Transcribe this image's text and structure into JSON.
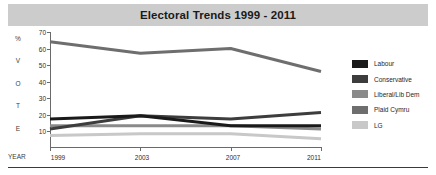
{
  "chart_data": {
    "type": "line",
    "title": "Electoral Trends 1999 - 2011",
    "xlabel": "YEAR",
    "ylabel": "% VOTE",
    "ylabel_chars": [
      "%",
      "V",
      "O",
      "T",
      "E"
    ],
    "categories": [
      "1999",
      "2003",
      "2007",
      "2011"
    ],
    "x": [
      1999,
      2003,
      2007,
      2011
    ],
    "ylim": [
      0,
      70
    ],
    "yticks": [
      70,
      60,
      50,
      40,
      30,
      20,
      10
    ],
    "grid": false,
    "legend_position": "right",
    "series": [
      {
        "name": "Labour",
        "color": "#1a1a1a",
        "values": [
          17,
          19,
          13,
          13
        ]
      },
      {
        "name": "Conservative",
        "color": "#3d3d3d",
        "values": [
          11,
          19,
          17,
          21
        ]
      },
      {
        "name": "Liberal/Lib Dem",
        "color": "#8a8a8a",
        "values": [
          13,
          13,
          13,
          11
        ]
      },
      {
        "name": "Plaid Cymru",
        "color": "#6e6e6e",
        "values": [
          64,
          57,
          60,
          46
        ]
      },
      {
        "name": "LG",
        "color": "#c8c8c8",
        "values": [
          7,
          8,
          8,
          5
        ]
      }
    ]
  },
  "legend": {
    "items": [
      {
        "label": "Labour",
        "color": "#1a1a1a"
      },
      {
        "label": "Conservative",
        "color": "#3d3d3d"
      },
      {
        "label": "Liberal/Lib Dem",
        "color": "#8a8a8a"
      },
      {
        "label": "Plaid Cymru",
        "color": "#6e6e6e"
      },
      {
        "label": "LG",
        "color": "#c8c8c8"
      }
    ]
  },
  "axes": {
    "y_tick_labels": [
      "70",
      "60",
      "50",
      "40",
      "30",
      "20",
      "10"
    ],
    "x_tick_labels": [
      "1999",
      "2003",
      "2007",
      "2011"
    ],
    "y_caption_chars": [
      "%",
      "V",
      "O",
      "T",
      "E"
    ],
    "x_caption": "YEAR"
  },
  "colors": {
    "title_band": "#cccccc",
    "axis": "#6a6a6a",
    "footer_rule": "#3a3a3a"
  }
}
